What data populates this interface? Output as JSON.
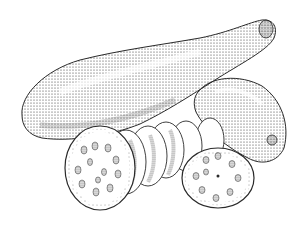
{
  "image": {
    "subject": "Stippled pen-and-ink illustration of zucchini squash with slices",
    "background_color": "#ffffff",
    "ink_color": "#2a2a2a",
    "elements": [
      {
        "name": "large-zucchini",
        "description": "Long whole zucchini lying diagonally, stem end at upper right"
      },
      {
        "name": "small-zucchini",
        "description": "Shorter whole zucchini behind at right"
      },
      {
        "name": "slice-stack",
        "description": "Row of overlapping round slices in front"
      },
      {
        "name": "front-slice-left",
        "description": "Large cut slice showing seeds at lower left"
      },
      {
        "name": "front-slice-right",
        "description": "Cut slice showing seeds at lower right"
      }
    ]
  }
}
